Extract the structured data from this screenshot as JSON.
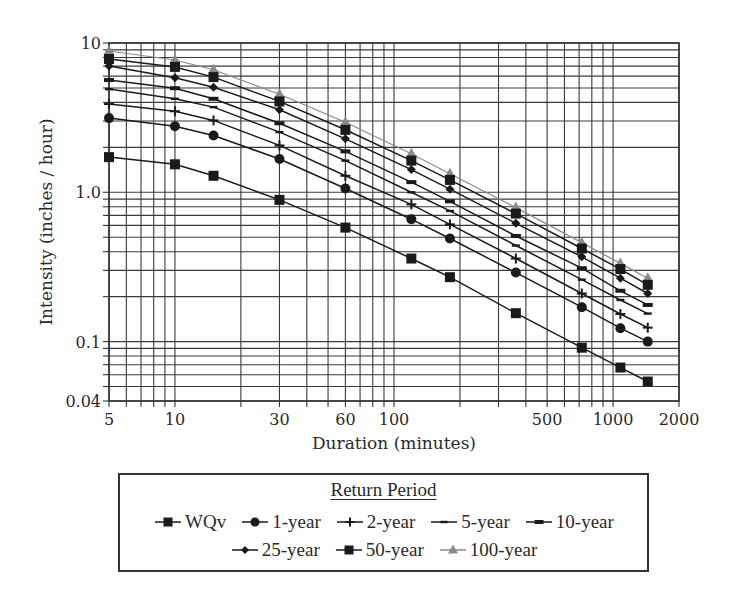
{
  "chart_data": {
    "type": "line",
    "title": "",
    "xlabel": "Duration (minutes)",
    "ylabel": "Intensity (inches / hour)",
    "xscale": "log",
    "yscale": "log",
    "xlim": [
      5,
      2000
    ],
    "ylim": [
      0.04,
      10
    ],
    "grid": true,
    "legend_position": "bottom (below plot)",
    "legend_title": "Return Period",
    "x_tick_labels": [
      "5",
      "10",
      "30",
      "60",
      "100",
      "500",
      "1000",
      "2000"
    ],
    "x_tick_values": [
      5,
      10,
      30,
      60,
      100,
      500,
      1000,
      2000
    ],
    "y_tick_labels": [
      "0.04",
      "0.1",
      "1.0",
      "10"
    ],
    "y_tick_values": [
      0.04,
      0.1,
      1.0,
      10
    ],
    "x": [
      5,
      10,
      15,
      30,
      60,
      120,
      180,
      360,
      720,
      1080,
      1440
    ],
    "series": [
      {
        "name": "WQv",
        "marker": "square",
        "color": "#1a1a1a",
        "values": [
          1.72,
          1.54,
          1.29,
          0.89,
          0.58,
          0.36,
          0.27,
          0.155,
          0.091,
          0.067,
          0.054
        ]
      },
      {
        "name": "1-year",
        "marker": "circle",
        "color": "#1a1a1a",
        "values": [
          3.14,
          2.77,
          2.4,
          1.67,
          1.06,
          0.66,
          0.49,
          0.29,
          0.17,
          0.123,
          0.1
        ]
      },
      {
        "name": "2-year",
        "marker": "plus",
        "color": "#1a1a1a",
        "values": [
          3.9,
          3.49,
          3.03,
          2.06,
          1.29,
          0.83,
          0.61,
          0.36,
          0.21,
          0.153,
          0.124
        ]
      },
      {
        "name": "5-year",
        "marker": "dash-thin",
        "color": "#1a1a1a",
        "values": [
          4.91,
          4.23,
          3.72,
          2.53,
          1.63,
          1.0,
          0.75,
          0.44,
          0.26,
          0.19,
          0.154
        ]
      },
      {
        "name": "10-year",
        "marker": "dash-thick",
        "color": "#1a1a1a",
        "values": [
          5.65,
          4.98,
          4.23,
          2.9,
          1.88,
          1.17,
          0.87,
          0.51,
          0.31,
          0.219,
          0.176
        ]
      },
      {
        "name": "25-year",
        "marker": "diamond",
        "color": "#1a1a1a",
        "values": [
          7.01,
          5.85,
          5.06,
          3.57,
          2.28,
          1.42,
          1.05,
          0.62,
          0.37,
          0.266,
          0.21
        ]
      },
      {
        "name": "50-year",
        "marker": "square",
        "color": "#1a1a1a",
        "values": [
          7.81,
          6.92,
          5.91,
          4.06,
          2.62,
          1.63,
          1.21,
          0.72,
          0.42,
          0.306,
          0.24
        ]
      },
      {
        "name": "100-year",
        "marker": "triangle",
        "color": "#8a8a8a",
        "values": [
          8.84,
          7.69,
          6.62,
          4.53,
          2.95,
          1.81,
          1.33,
          0.79,
          0.46,
          0.334,
          0.266
        ]
      }
    ]
  },
  "legend": {
    "title": "Return Period",
    "rows": [
      [
        {
          "label": "WQv",
          "marker": "square",
          "color": "#1a1a1a"
        },
        {
          "label": "1-year",
          "marker": "circle",
          "color": "#1a1a1a"
        },
        {
          "label": "2-year",
          "marker": "plus",
          "color": "#1a1a1a"
        },
        {
          "label": "5-year",
          "marker": "dash-thin",
          "color": "#1a1a1a"
        },
        {
          "label": "10-year",
          "marker": "dash-thick",
          "color": "#1a1a1a"
        }
      ],
      [
        {
          "label": "25-year",
          "marker": "diamond",
          "color": "#1a1a1a"
        },
        {
          "label": "50-year",
          "marker": "square",
          "color": "#1a1a1a"
        },
        {
          "label": "100-year",
          "marker": "triangle",
          "color": "#8a8a8a"
        }
      ]
    ]
  }
}
